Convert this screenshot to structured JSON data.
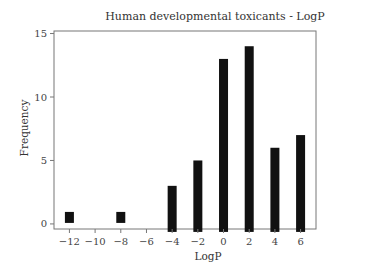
{
  "chart_data": {
    "type": "bar",
    "title": "Human developmental toxicants - LogP",
    "xlabel": "LogP",
    "ylabel": "Frequency",
    "x": [
      -12,
      -8,
      -4,
      -2,
      0,
      2,
      4,
      6
    ],
    "values": [
      1,
      1,
      3,
      5,
      13,
      14,
      6,
      7
    ],
    "xticks": [
      -12,
      -10,
      -8,
      -6,
      -4,
      -2,
      0,
      2,
      4,
      6
    ],
    "yticks": [
      0,
      5,
      10,
      15
    ],
    "xlim": [
      -13.2,
      7.2
    ],
    "ylim": [
      -0.4,
      15.2
    ],
    "bar_color": "#111111",
    "grid": false
  }
}
